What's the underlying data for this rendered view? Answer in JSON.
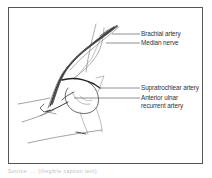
{
  "figure": {
    "labels": [
      {
        "id": "brachial-artery",
        "text": "Brachial artery"
      },
      {
        "id": "median-nerve",
        "text": "Median nerve"
      },
      {
        "id": "supratrochlear-artery",
        "text": "Supratrochlear artery"
      },
      {
        "id": "anterior-ulnar-recurrent-artery",
        "line1": "Anterior ulnar",
        "line2": "recurrent artery"
      }
    ],
    "caption": "Source: ... (illegible caption text)"
  },
  "colors": {
    "line": "#444444",
    "frame": "#555555",
    "background": "#ffffff"
  }
}
